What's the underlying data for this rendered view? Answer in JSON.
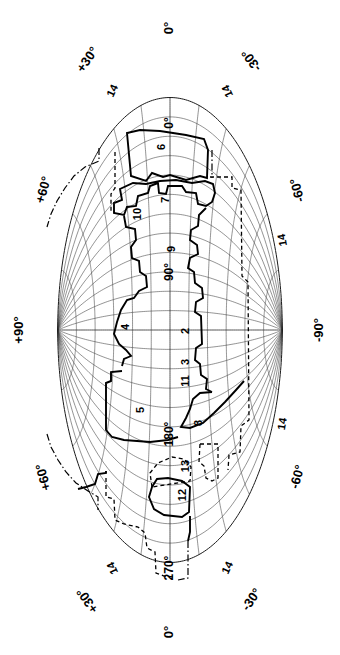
{
  "figure": {
    "name": "all-sky-projection-map",
    "projection": "Aitoff",
    "orientation": "rotated-90-degrees",
    "width": 340,
    "height": 655,
    "background_color": "#ffffff",
    "line_color": "#000000",
    "graticule_color": "#3a3a3a"
  },
  "chart_data": {
    "type": "scatter",
    "title": "",
    "xlabel": "",
    "ylabel": "",
    "projection": "aitoff",
    "grid": true,
    "legend": "none",
    "latitude_ticks": [
      "+90°",
      "+60°",
      "+30°",
      "0°",
      "-30°",
      "-60°",
      "-90°"
    ],
    "longitude_ticks": [
      "0°",
      "90°",
      "180°",
      "270°"
    ],
    "graticule_spacing_deg": 15,
    "region_count": 14
  },
  "labels": {
    "outer": [
      {
        "id": "lat-plus-90",
        "text": "+90°",
        "x": 20,
        "y": 330,
        "rotate": -90
      },
      {
        "id": "lat-minus-90",
        "text": "-90°",
        "x": 320,
        "y": 330,
        "rotate": -90
      },
      {
        "id": "lat-plus-30-top",
        "text": "+30°",
        "x": 88,
        "y": 60,
        "rotate": -55
      },
      {
        "id": "lat-minus-30-top",
        "text": "-30°",
        "x": 252,
        "y": 60,
        "rotate": -125
      },
      {
        "id": "lat-plus-60-top",
        "text": "+60°",
        "x": 44,
        "y": 190,
        "rotate": -75
      },
      {
        "id": "lat-minus-60-top",
        "text": "-60°",
        "x": 298,
        "y": 190,
        "rotate": -105
      },
      {
        "id": "lat-plus-60-bottom",
        "text": "+60°",
        "x": 44,
        "y": 477,
        "rotate": -105
      },
      {
        "id": "lat-minus-60-bottom",
        "text": "-60°",
        "x": 298,
        "y": 477,
        "rotate": -75
      },
      {
        "id": "lat-plus-30-bottom",
        "text": "+30°",
        "x": 88,
        "y": 600,
        "rotate": -125
      },
      {
        "id": "lat-minus-30-bottom",
        "text": "-30°",
        "x": 252,
        "y": 600,
        "rotate": -55
      },
      {
        "id": "lon-0-top",
        "text": "0°",
        "x": 170,
        "y": 28,
        "rotate": -90
      },
      {
        "id": "lon-0-bottom",
        "text": "0°",
        "x": 170,
        "y": 632,
        "rotate": -90
      }
    ],
    "inner": [
      {
        "id": "lon-0-inner",
        "text": "0°",
        "x": 170,
        "y": 123,
        "rotate": -90
      },
      {
        "id": "lon-90-inner",
        "text": "90°",
        "x": 170,
        "y": 272,
        "rotate": -90
      },
      {
        "id": "lon-180-inner",
        "text": "180°",
        "x": 170,
        "y": 434,
        "rotate": -90
      },
      {
        "id": "lon-270-inner",
        "text": "270°",
        "x": 170,
        "y": 568,
        "rotate": -90
      }
    ],
    "regions": [
      {
        "id": "region-2",
        "text": "2",
        "x": 186,
        "y": 331,
        "rotate": -90
      },
      {
        "id": "region-3",
        "text": "3",
        "x": 186,
        "y": 362,
        "rotate": -90
      },
      {
        "id": "region-4",
        "text": "4",
        "x": 126,
        "y": 327,
        "rotate": -90
      },
      {
        "id": "region-5",
        "text": "5",
        "x": 141,
        "y": 410,
        "rotate": -90
      },
      {
        "id": "region-6",
        "text": "6",
        "x": 162,
        "y": 147,
        "rotate": -90
      },
      {
        "id": "region-7",
        "text": "7",
        "x": 166,
        "y": 200,
        "rotate": -90
      },
      {
        "id": "region-8",
        "text": "8",
        "x": 199,
        "y": 423,
        "rotate": -90
      },
      {
        "id": "region-9",
        "text": "9",
        "x": 172,
        "y": 249,
        "rotate": -90
      },
      {
        "id": "region-10",
        "text": "10",
        "x": 138,
        "y": 214,
        "rotate": -90
      },
      {
        "id": "region-11",
        "text": "11",
        "x": 186,
        "y": 381,
        "rotate": -90
      },
      {
        "id": "region-12",
        "text": "12",
        "x": 183,
        "y": 495,
        "rotate": -90
      },
      {
        "id": "region-13",
        "text": "13",
        "x": 186,
        "y": 466,
        "rotate": -90
      }
    ],
    "bands": [
      {
        "id": "band-14-top-left",
        "text": "14",
        "x": 113,
        "y": 91,
        "rotate": -65
      },
      {
        "id": "band-14-top-right",
        "text": "14",
        "x": 228,
        "y": 91,
        "rotate": -115
      },
      {
        "id": "band-14-mid-right",
        "text": "14",
        "x": 283,
        "y": 240,
        "rotate": -100
      },
      {
        "id": "band-14-low-right",
        "text": "14",
        "x": 283,
        "y": 424,
        "rotate": -80
      },
      {
        "id": "band-14-bottom-left",
        "text": "14",
        "x": 113,
        "y": 568,
        "rotate": -115
      },
      {
        "id": "band-14-bottom-right",
        "text": "14",
        "x": 228,
        "y": 568,
        "rotate": -65
      }
    ]
  }
}
